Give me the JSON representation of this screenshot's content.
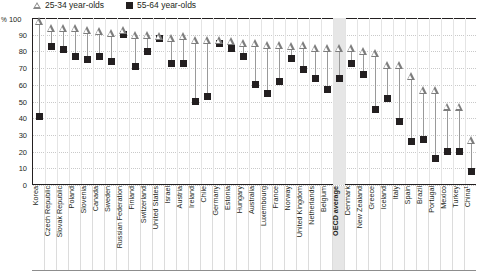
{
  "legend": {
    "items": [
      {
        "icon": "triangle-outline-marker",
        "label": "25-34 year-olds"
      },
      {
        "icon": "black-square-marker",
        "label": "55-64 year-olds"
      }
    ]
  },
  "axis": {
    "unit_symbol": "%",
    "unit_top": "100",
    "y_ticks": [
      "100",
      "90",
      "80",
      "70",
      "60",
      "50",
      "40",
      "30",
      "20",
      "10",
      "0"
    ]
  },
  "highlight": {
    "category": "OECD average",
    "color": "#e6e6e6"
  },
  "chart_data": {
    "type": "scatter",
    "title": "",
    "xlabel": "",
    "ylabel": "%",
    "ylim": [
      0,
      100
    ],
    "grid": true,
    "legend_position": "top-left",
    "categories": [
      "Korea",
      "Czech Republic",
      "Slovak Republic",
      "Poland",
      "Slovenia",
      "Canada",
      "Sweden",
      "Russian Federation",
      "Finland",
      "Switzerland",
      "United States",
      "Israel",
      "Austria",
      "Ireland",
      "Chile",
      "Germany",
      "Estonia",
      "Hungary",
      "Australia",
      "Luxembourg",
      "France",
      "Norway",
      "United Kingdom",
      "Netherlands",
      "Belgium",
      "OECD average",
      "Denmark",
      "New Zealand",
      "Greece",
      "Iceland",
      "Italy",
      "Spain",
      "Brazil",
      "Portugal",
      "Mexico",
      "Turkey",
      "China¹"
    ],
    "series": [
      {
        "name": "25-34 year-olds",
        "marker": "triangle-outline",
        "values": [
          98,
          94,
          94,
          94,
          93,
          92,
          91,
          93,
          90,
          90,
          89,
          88,
          89,
          87,
          87,
          87,
          86,
          85,
          85,
          84,
          84,
          83,
          84,
          82,
          82,
          82,
          82,
          80,
          79,
          72,
          72,
          65,
          57,
          57,
          47,
          47,
          27
        ]
      },
      {
        "name": "55-64 year-olds",
        "marker": "black-square",
        "values": [
          41,
          83,
          81,
          77,
          75,
          77,
          74,
          90,
          71,
          80,
          88,
          73,
          73,
          50,
          53,
          85,
          82,
          77,
          60,
          55,
          62,
          76,
          69,
          64,
          57,
          64,
          73,
          66,
          45,
          52,
          38,
          26,
          27,
          16,
          20,
          20,
          8
        ]
      }
    ],
    "notes": [
      "¹"
    ]
  }
}
